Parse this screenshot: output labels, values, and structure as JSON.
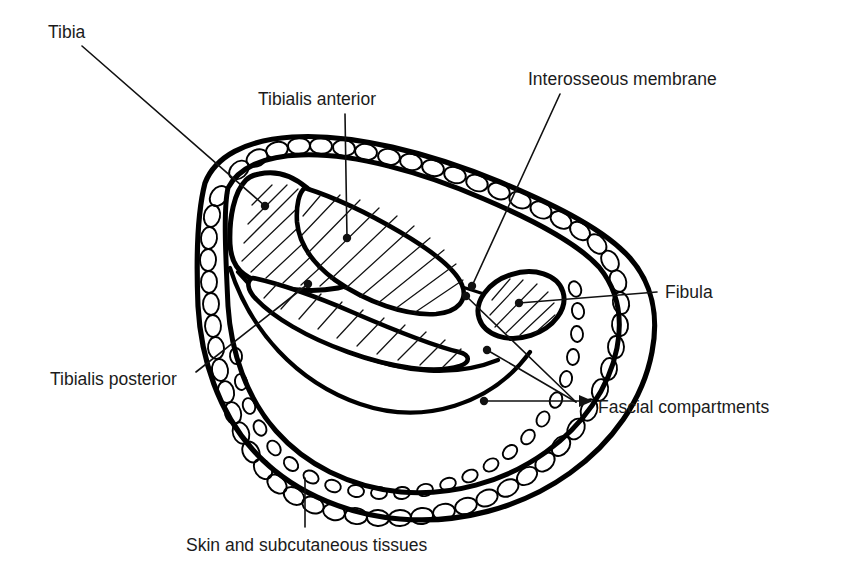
{
  "figure": {
    "kind": "anatomical-cross-section-diagram",
    "background_color": "#ffffff",
    "line_color": "#000000",
    "text_color": "#1b1b1b"
  },
  "labels": [
    {
      "id": "tibia",
      "text": "Tibia",
      "x": 48,
      "y": 38,
      "anchor": "start",
      "leader": {
        "type": "line-dot",
        "from": [
          82,
          46
        ],
        "to": [
          265,
          206
        ]
      }
    },
    {
      "id": "tibialis-anterior",
      "text": "Tibialis anterior",
      "x": 258,
      "y": 105,
      "anchor": "start",
      "leader": {
        "type": "line-dot",
        "from": [
          345,
          114
        ],
        "to": [
          347,
          238
        ]
      }
    },
    {
      "id": "interosseous-membrane",
      "text": "Interosseous membrane",
      "x": 528,
      "y": 85,
      "anchor": "start",
      "leader": {
        "type": "line-dot",
        "from": [
          560,
          94
        ],
        "to": [
          472,
          286
        ]
      }
    },
    {
      "id": "fibula",
      "text": "Fibula",
      "x": 665,
      "y": 298,
      "anchor": "start",
      "leader": {
        "type": "line-dot",
        "from": [
          657,
          292
        ],
        "to": [
          519,
          303
        ]
      }
    },
    {
      "id": "fascial-compartments",
      "text": "Fascial compartments",
      "x": 598,
      "y": 413,
      "anchor": "start",
      "leader": {
        "type": "line-dot",
        "from": [
          484,
          401
        ],
        "to": [
          590,
          401
        ]
      },
      "extra_leaders": [
        {
          "from": [
            573,
            404
          ],
          "to": [
            487,
            350
          ]
        },
        {
          "from": [
            573,
            404
          ],
          "to": [
            466,
            296
          ]
        }
      ]
    },
    {
      "id": "tibialis-posterior",
      "text": "Tibialis posterior",
      "x": 50,
      "y": 385,
      "anchor": "start",
      "leader": {
        "type": "line-dot",
        "from": [
          196,
          372
        ],
        "to": [
          308,
          284
        ]
      }
    },
    {
      "id": "skin-and-subcutaneous-tissues",
      "text": "Skin and subcutaneous tissues",
      "x": 186,
      "y": 551,
      "anchor": "start",
      "leader": {
        "type": "line",
        "from": [
          305,
          527
        ],
        "to": [
          305,
          478
        ]
      }
    }
  ],
  "structures": [
    {
      "id": "skin-subcutaneous-band",
      "name": "Skin and subcutaneous tissues",
      "rendering": "stippled fatty band around whole section"
    },
    {
      "id": "deep-fascia",
      "name": "Deep fascia / fascial compartments",
      "rendering": "heavy closed outline inside the fat band"
    },
    {
      "id": "tibia-bone",
      "name": "Tibia",
      "rendering": "large triangular hatched bone, antero-medial"
    },
    {
      "id": "fibula-bone",
      "name": "Fibula",
      "rendering": "small oval hatched bone, lateral"
    },
    {
      "id": "tibialis-anterior-muscle",
      "name": "Tibialis anterior",
      "rendering": "elongated hatched muscle belly, anterior compartment"
    },
    {
      "id": "tibialis-posterior-muscle",
      "name": "Tibialis posterior",
      "rendering": "crescentic hatched muscle, deep posterior compartment"
    },
    {
      "id": "interosseous-membrane-line",
      "name": "Interosseous membrane",
      "rendering": "line between tibia and fibula"
    }
  ]
}
